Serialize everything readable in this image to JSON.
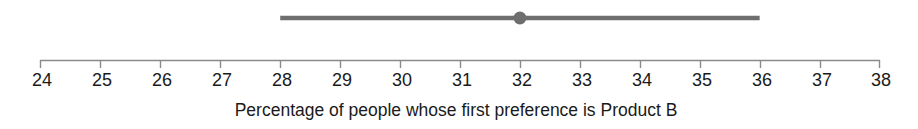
{
  "chart_data": {
    "type": "scatter",
    "title": "",
    "subtitle": "",
    "xlabel": "Percentage of people whose first preference is Product B",
    "ylabel": "",
    "xlim": [
      24,
      38
    ],
    "grid": false,
    "legend": null,
    "tick_labels": [
      "24",
      "25",
      "26",
      "27",
      "28",
      "29",
      "30",
      "31",
      "32",
      "33",
      "34",
      "35",
      "36",
      "37",
      "38"
    ],
    "ticks": [
      24,
      25,
      26,
      27,
      28,
      29,
      30,
      31,
      32,
      33,
      34,
      35,
      36,
      37,
      38
    ],
    "series": [
      {
        "name": "Product B first preference",
        "type": "errorbar",
        "estimate": 32,
        "ci_low": 28,
        "ci_high": 36,
        "marker": "circle",
        "color": "#6e6e6e"
      }
    ],
    "annotations": []
  },
  "axis": {
    "line_color": "#8a8a8a",
    "tick_color": "#8a8a8a"
  },
  "interval": {
    "color": "#6e6e6e",
    "marker_color": "#6e6e6e"
  }
}
